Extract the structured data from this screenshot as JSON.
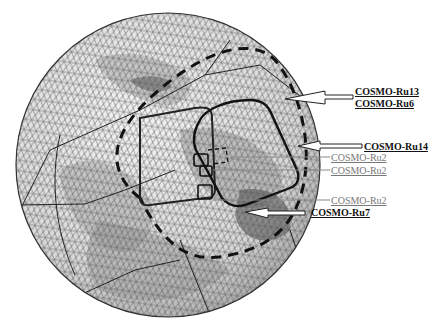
{
  "figure": {
    "title": ""
  },
  "labels": {
    "ru13": "COSMO-Ru13",
    "ru6": "COSMO-Ru6",
    "ru14": "COSMO-Ru14",
    "ru2_a": "COSMO-Ru2",
    "ru2_b": "COSMO-Ru2",
    "ru2_c": "COSMO-Ru2",
    "ru7": "COSMO-Ru7"
  },
  "colors": {
    "background": "#ffffff",
    "grid": "#555555",
    "domain_outline": "#1a1a1a",
    "light_label": "#777777",
    "bold_label": "#111111"
  }
}
